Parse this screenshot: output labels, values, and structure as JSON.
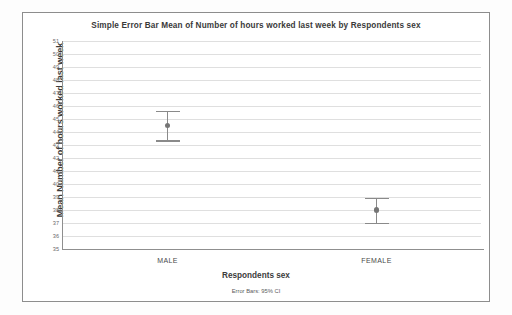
{
  "chart_data": {
    "type": "scatter",
    "title": "Simple Error Bar Mean of Number of hours worked last week by Respondents sex",
    "xlabel": "Respondents sex",
    "ylabel": "Mean Number of hours worked last week",
    "footnote": "Error Bars: 95% CI",
    "categories": [
      "MALE",
      "FEMALE"
    ],
    "values": [
      44.5,
      38.0
    ],
    "ci_lower": [
      43.35,
      37.0
    ],
    "ci_upper": [
      45.65,
      38.95
    ],
    "ylim": [
      35,
      51
    ],
    "ytick_labels": [
      "51",
      "50",
      "49",
      "48",
      "47",
      "46",
      "45",
      "44",
      "43",
      "42",
      "41",
      "40",
      "39",
      "38",
      "37",
      "36",
      "35"
    ],
    "ytick_values": [
      51,
      50,
      49,
      48,
      47,
      46,
      45,
      44,
      43,
      42,
      41,
      40,
      39,
      38,
      37,
      36,
      35
    ],
    "grid": true,
    "legend": "none",
    "series": [
      {
        "name": "Mean Number of hours worked last week",
        "points": [
          {
            "category": "MALE",
            "mean": 44.5,
            "lower": 43.35,
            "upper": 45.65
          },
          {
            "category": "FEMALE",
            "mean": 38.0,
            "lower": 37.0,
            "upper": 38.95
          }
        ]
      }
    ],
    "colors": {
      "marker": "#757575",
      "errorbar": "#8a8a8a",
      "gridline": "#dfdfdf",
      "axis": "#8f8f8f",
      "frame": "#8d8d8d",
      "text": "#3b3b3b",
      "background": "#ffffff"
    }
  }
}
